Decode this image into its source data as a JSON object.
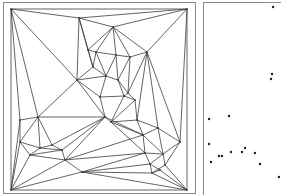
{
  "figure": {
    "colors": {
      "background": "#ffffff",
      "frame": "#8a8a8a",
      "edge": "#3c3c3c",
      "point": "#1e1e1e"
    }
  },
  "left_panel": {
    "outer_frame": [
      3,
      2,
      192,
      191
    ],
    "inner_frame": [
      11,
      9,
      176,
      181
    ],
    "vertices": [
      [
        11,
        9
      ],
      [
        187,
        9
      ],
      [
        11,
        190
      ],
      [
        187,
        190
      ],
      [
        79,
        18
      ],
      [
        113,
        27
      ],
      [
        147,
        52
      ],
      [
        88,
        50
      ],
      [
        96,
        52
      ],
      [
        116,
        55
      ],
      [
        130,
        57
      ],
      [
        93,
        67
      ],
      [
        77,
        80
      ],
      [
        106,
        76
      ],
      [
        118,
        80
      ],
      [
        128,
        93
      ],
      [
        124,
        96
      ],
      [
        100,
        97
      ],
      [
        105,
        117
      ],
      [
        111,
        122
      ],
      [
        137,
        120
      ],
      [
        38,
        117
      ],
      [
        20,
        120
      ],
      [
        20,
        142
      ],
      [
        30,
        155
      ],
      [
        40,
        148
      ],
      [
        52,
        145
      ],
      [
        62,
        150
      ],
      [
        65,
        160
      ],
      [
        143,
        135
      ],
      [
        158,
        128
      ],
      [
        180,
        142
      ],
      [
        145,
        153
      ],
      [
        150,
        164
      ],
      [
        163,
        154
      ],
      [
        165,
        165
      ],
      [
        152,
        173
      ],
      [
        82,
        172
      ],
      [
        135,
        100
      ],
      [
        160,
        170
      ]
    ],
    "edges": [
      [
        0,
        1
      ],
      [
        1,
        3
      ],
      [
        3,
        2
      ],
      [
        2,
        0
      ],
      [
        0,
        4
      ],
      [
        4,
        1
      ],
      [
        4,
        5
      ],
      [
        5,
        1
      ],
      [
        5,
        6
      ],
      [
        6,
        1
      ],
      [
        0,
        12
      ],
      [
        4,
        7
      ],
      [
        4,
        12
      ],
      [
        4,
        11
      ],
      [
        5,
        7
      ],
      [
        5,
        8
      ],
      [
        5,
        9
      ],
      [
        5,
        10
      ],
      [
        9,
        10
      ],
      [
        10,
        6
      ],
      [
        7,
        8
      ],
      [
        8,
        9
      ],
      [
        7,
        11
      ],
      [
        8,
        11
      ],
      [
        8,
        13
      ],
      [
        9,
        13
      ],
      [
        9,
        14
      ],
      [
        10,
        14
      ],
      [
        10,
        15
      ],
      [
        6,
        15
      ],
      [
        6,
        30
      ],
      [
        11,
        12
      ],
      [
        11,
        13
      ],
      [
        12,
        13
      ],
      [
        13,
        14
      ],
      [
        14,
        15
      ],
      [
        14,
        16
      ],
      [
        15,
        16
      ],
      [
        13,
        17
      ],
      [
        16,
        17
      ],
      [
        12,
        17
      ],
      [
        12,
        21
      ],
      [
        0,
        21
      ],
      [
        0,
        22
      ],
      [
        21,
        22
      ],
      [
        12,
        18
      ],
      [
        17,
        18
      ],
      [
        18,
        21
      ],
      [
        18,
        19
      ],
      [
        16,
        19
      ],
      [
        19,
        38
      ],
      [
        15,
        38
      ],
      [
        38,
        20
      ],
      [
        19,
        20
      ],
      [
        16,
        38
      ],
      [
        6,
        20
      ],
      [
        1,
        31
      ],
      [
        6,
        31
      ],
      [
        20,
        30
      ],
      [
        30,
        31
      ],
      [
        20,
        29
      ],
      [
        19,
        29
      ],
      [
        29,
        30
      ],
      [
        22,
        23
      ],
      [
        21,
        23
      ],
      [
        21,
        25
      ],
      [
        21,
        26
      ],
      [
        23,
        25
      ],
      [
        25,
        26
      ],
      [
        23,
        24
      ],
      [
        24,
        25
      ],
      [
        25,
        27
      ],
      [
        26,
        27
      ],
      [
        26,
        18
      ],
      [
        27,
        18
      ],
      [
        27,
        28
      ],
      [
        24,
        28
      ],
      [
        24,
        27
      ],
      [
        22,
        2
      ],
      [
        23,
        2
      ],
      [
        24,
        2
      ],
      [
        28,
        2
      ],
      [
        28,
        37
      ],
      [
        2,
        37
      ],
      [
        37,
        3
      ],
      [
        18,
        29
      ],
      [
        28,
        29
      ],
      [
        19,
        32
      ],
      [
        29,
        32
      ],
      [
        32,
        34
      ],
      [
        29,
        34
      ],
      [
        34,
        30
      ],
      [
        34,
        31
      ],
      [
        32,
        33
      ],
      [
        33,
        34
      ],
      [
        34,
        35
      ],
      [
        35,
        31
      ],
      [
        35,
        3
      ],
      [
        33,
        36
      ],
      [
        36,
        35
      ],
      [
        36,
        3
      ],
      [
        33,
        39
      ],
      [
        39,
        3
      ],
      [
        36,
        39
      ],
      [
        37,
        36
      ],
      [
        37,
        33
      ],
      [
        28,
        32
      ],
      [
        18,
        28
      ],
      [
        37,
        32
      ]
    ]
  },
  "right_panel": {
    "outer_frame": [
      203,
      2,
      80,
      193
    ],
    "points": [
      [
        273,
        7
      ],
      [
        272,
        74
      ],
      [
        271,
        79
      ],
      [
        209,
        119
      ],
      [
        229,
        116
      ],
      [
        209,
        144
      ],
      [
        211,
        162
      ],
      [
        219,
        156
      ],
      [
        222,
        156
      ],
      [
        231,
        152
      ],
      [
        242,
        152
      ],
      [
        245,
        148
      ],
      [
        255,
        153
      ],
      [
        260,
        164
      ],
      [
        279,
        177
      ]
    ]
  }
}
